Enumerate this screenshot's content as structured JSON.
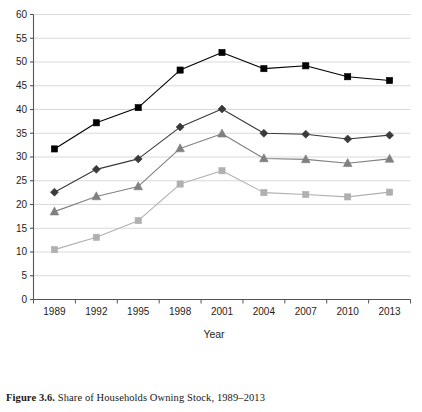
{
  "figure": {
    "caption_label": "Figure 3.6.",
    "caption_text": " Share of Households Owning Stock, 1989–2013"
  },
  "axes": {
    "x_title": "Year",
    "y_title": "",
    "x_tick_labels": [
      "1989",
      "1992",
      "1995",
      "1998",
      "2001",
      "2004",
      "2007",
      "2010",
      "2013"
    ],
    "y_tick_labels": [
      "0",
      "5",
      "10",
      "15",
      "20",
      "25",
      "30",
      "35",
      "40",
      "45",
      "50",
      "55",
      "60"
    ]
  },
  "legend": {
    "entries": [
      {
        "label": "Any Stocks",
        "marker": "square",
        "color": "#000000"
      },
      {
        "label": "$5,000 or more",
        "marker": "diamond",
        "color": "#3a3a3a"
      },
      {
        "label": "$10,000 or more",
        "marker": "triangle",
        "color": "#808080"
      },
      {
        "label": "$25,000 or more",
        "marker": "square",
        "color": "#b0b0b0"
      }
    ]
  },
  "chart_data": {
    "type": "line",
    "title": "Share of Households Owning Stock, 1989–2013",
    "xlabel": "Year",
    "ylabel": "",
    "xlim": [
      1989,
      2013
    ],
    "ylim": [
      0,
      60
    ],
    "ytick_step": 5,
    "grid": true,
    "legend_position": "bottom",
    "x": [
      1989,
      1992,
      1995,
      1998,
      2001,
      2004,
      2007,
      2010,
      2013
    ],
    "categories": [
      "1989",
      "1992",
      "1995",
      "1998",
      "2001",
      "2004",
      "2007",
      "2010",
      "2013"
    ],
    "series": [
      {
        "name": "Any Stocks",
        "marker": "square",
        "color": "#000000",
        "values": [
          31.7,
          37.2,
          40.4,
          48.3,
          52.0,
          48.6,
          49.2,
          46.9,
          46.1
        ]
      },
      {
        "name": "$5,000 or more",
        "marker": "diamond",
        "color": "#3a3a3a",
        "values": [
          22.6,
          27.4,
          29.6,
          36.3,
          40.1,
          35.0,
          34.8,
          33.8,
          34.6
        ]
      },
      {
        "name": "$10,000 or more",
        "marker": "triangle",
        "color": "#808080",
        "values": [
          18.5,
          21.7,
          23.8,
          31.8,
          34.9,
          29.7,
          29.5,
          28.7,
          29.6
        ]
      },
      {
        "name": "$25,000 or more",
        "marker": "square",
        "color": "#b0b0b0",
        "values": [
          10.5,
          13.1,
          16.6,
          24.3,
          27.1,
          22.5,
          22.1,
          21.6,
          22.6
        ]
      }
    ]
  }
}
